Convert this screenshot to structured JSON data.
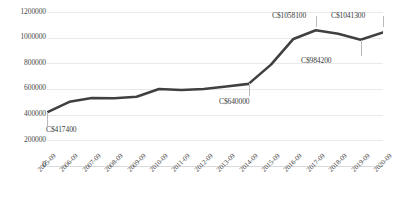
{
  "chart_data": {
    "type": "line",
    "title": "",
    "xlabel": "",
    "ylabel": "",
    "categories": [
      "2005-09",
      "2006-09",
      "2007-09",
      "2008-09",
      "2009-09",
      "2010-09",
      "2011-09",
      "2012-09",
      "2013-09",
      "2014-09",
      "2015-09",
      "2016-09",
      "2017-09",
      "2018-09",
      "2019-09",
      "2020-09"
    ],
    "values": [
      417400,
      500000,
      530000,
      528000,
      540000,
      600000,
      592000,
      600000,
      620000,
      640000,
      790000,
      990000,
      1058100,
      1030000,
      984200,
      1041300
    ],
    "ylim": [
      0,
      1200000
    ],
    "yticks": [
      0,
      200000,
      400000,
      600000,
      800000,
      1000000,
      1200000
    ],
    "ytick_labels": [
      "0",
      "200000",
      "400000",
      "600000",
      "800000",
      "1000000",
      "1200000"
    ],
    "grid": true,
    "legend": false,
    "series_color": "#404040",
    "grid_color": "#e9e9e9",
    "annotations": [
      {
        "index": 0,
        "text": "C$417400",
        "value": 417400
      },
      {
        "index": 9,
        "text": "C$640000",
        "value": 640000
      },
      {
        "index": 12,
        "text": "C$1058100",
        "value": 1058100
      },
      {
        "index": 14,
        "text": "C$984200",
        "value": 984200
      },
      {
        "index": 15,
        "text": "C$1041300",
        "value": 1041300
      }
    ]
  }
}
